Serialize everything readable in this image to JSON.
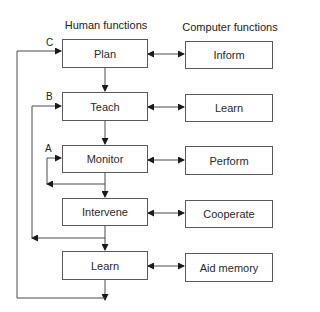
{
  "headers": {
    "human": "Human functions",
    "computer": "Computer functions"
  },
  "human_functions": [
    {
      "label": "Plan"
    },
    {
      "label": "Teach"
    },
    {
      "label": "Monitor"
    },
    {
      "label": "Intervene"
    },
    {
      "label": "Learn"
    }
  ],
  "computer_functions": [
    {
      "label": "Inform"
    },
    {
      "label": "Learn"
    },
    {
      "label": "Perform"
    },
    {
      "label": "Cooperate"
    },
    {
      "label": "Aid memory"
    }
  ],
  "loop_labels": {
    "a": "A",
    "b": "B",
    "c": "C"
  },
  "connections": [
    {
      "from": "Plan",
      "to": "Inform",
      "type": "bidirectional"
    },
    {
      "from": "Teach",
      "to": "Learn",
      "type": "bidirectional"
    },
    {
      "from": "Monitor",
      "to": "Perform",
      "type": "bidirectional"
    },
    {
      "from": "Intervene",
      "to": "Cooperate",
      "type": "bidirectional"
    },
    {
      "from": "Learn",
      "to": "Aid memory",
      "type": "bidirectional"
    },
    {
      "from": "Plan",
      "to": "Teach",
      "type": "arrow"
    },
    {
      "from": "Teach",
      "to": "Monitor",
      "type": "arrow"
    },
    {
      "from": "Monitor",
      "to": "Intervene",
      "type": "arrow"
    },
    {
      "from": "Intervene",
      "to": "Learn",
      "type": "arrow"
    },
    {
      "from": "Monitor",
      "to": "Monitor",
      "type": "feedback",
      "label": "A"
    },
    {
      "from": "Intervene",
      "to": "Teach",
      "type": "feedback",
      "label": "B"
    },
    {
      "from": "Learn",
      "to": "Plan",
      "type": "feedback",
      "label": "C"
    }
  ]
}
